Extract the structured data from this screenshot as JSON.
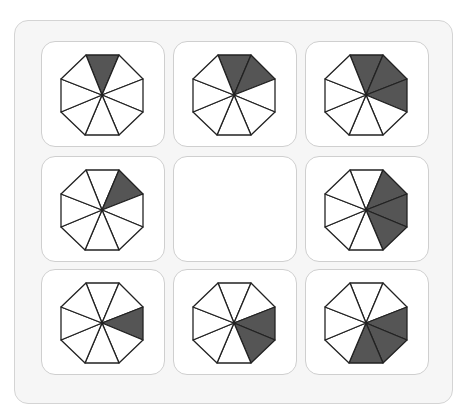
{
  "puzzle": {
    "type": "3x3 matrix pattern puzzle",
    "shape": "octagon divided into 8 triangular sectors",
    "sector_order": [
      "top",
      "upper-right",
      "right",
      "lower-right",
      "bottom",
      "lower-left",
      "left",
      "upper-left"
    ],
    "colors": {
      "shade": "#555555",
      "stroke": "#222222",
      "card_bg": "#ffffff",
      "panel_bg": "#f6f6f6",
      "card_border": "#cfcfcf"
    },
    "cells": [
      {
        "row": 1,
        "col": 1,
        "shaded": [
          "top"
        ]
      },
      {
        "row": 1,
        "col": 2,
        "shaded": [
          "top",
          "upper-right"
        ]
      },
      {
        "row": 1,
        "col": 3,
        "shaded": [
          "top",
          "upper-right",
          "right"
        ]
      },
      {
        "row": 2,
        "col": 1,
        "shaded": [
          "upper-right"
        ]
      },
      {
        "row": 2,
        "col": 2,
        "shaded": null,
        "missing": true
      },
      {
        "row": 2,
        "col": 3,
        "shaded": [
          "upper-right",
          "right",
          "lower-right"
        ]
      },
      {
        "row": 3,
        "col": 1,
        "shaded": [
          "right"
        ]
      },
      {
        "row": 3,
        "col": 2,
        "shaded": [
          "right",
          "lower-right"
        ]
      },
      {
        "row": 3,
        "col": 3,
        "shaded": [
          "right",
          "lower-right",
          "bottom"
        ]
      }
    ]
  }
}
